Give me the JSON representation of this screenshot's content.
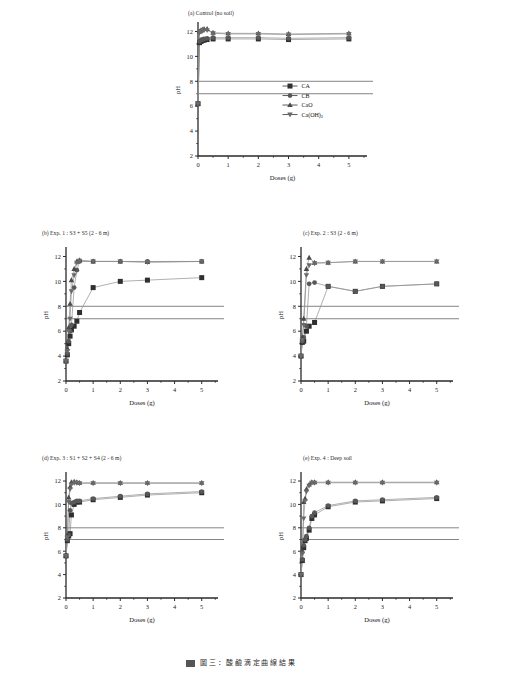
{
  "figure": {
    "caption_fragment": "圖 三 ： 酸 鹼 滴 定 曲 線 結 果"
  },
  "legend": {
    "position": "inside-lower-right-panel-a",
    "items": [
      {
        "label": "CA",
        "marker": "filled-square",
        "icon_name": "legend-marker-square"
      },
      {
        "label": "CB",
        "marker": "filled-circle",
        "icon_name": "legend-marker-circle"
      },
      {
        "label": "CaO",
        "marker": "filled-triangle",
        "icon_name": "legend-marker-triangle-up"
      },
      {
        "label": "Ca(OH)2",
        "marker": "filled-triangle-down",
        "icon_name": "legend-marker-triangle-down"
      }
    ]
  },
  "colors": {
    "axis": "#2b2b2b",
    "reference_line": "#6e6e6e",
    "series_line": "#8e8e8e",
    "marker_dark": "#2f2f2f",
    "marker_mid": "#585858",
    "background": "#ffffff"
  },
  "chart_data": [
    {
      "id": "panel-a",
      "type": "scatter",
      "title": "(a) Control (no soil)",
      "xlabel": "Doses (g)",
      "ylabel": "pH",
      "xlim": [
        0,
        5.6
      ],
      "ylim": [
        2,
        12.6
      ],
      "xticks": [
        0,
        1,
        2,
        3,
        4,
        5
      ],
      "yticks": [
        2,
        4,
        6,
        8,
        10,
        12
      ],
      "grid": false,
      "reference_lines": [
        8.0,
        7.0
      ],
      "series": [
        {
          "name": "CA",
          "marker": "filled-square",
          "x": [
            0,
            0.05,
            0.1,
            0.15,
            0.2,
            0.3,
            0.5,
            1,
            2,
            3,
            5
          ],
          "y": [
            6.2,
            11.1,
            11.2,
            11.3,
            11.3,
            11.35,
            11.4,
            11.4,
            11.4,
            11.35,
            11.4
          ]
        },
        {
          "name": "CB",
          "marker": "filled-circle",
          "x": [
            0,
            0.05,
            0.1,
            0.15,
            0.2,
            0.3,
            0.5,
            1,
            2,
            3,
            5
          ],
          "y": [
            6.2,
            11.2,
            11.3,
            11.35,
            11.4,
            11.45,
            11.5,
            11.5,
            11.5,
            11.45,
            11.5
          ]
        },
        {
          "name": "CaO",
          "marker": "filled-triangle",
          "x": [
            0,
            0.05,
            0.1,
            0.15,
            0.2,
            0.3,
            0.5,
            1,
            2,
            3,
            5
          ],
          "y": [
            6.2,
            12.0,
            12.1,
            12.15,
            12.2,
            12.2,
            11.9,
            11.85,
            11.85,
            11.8,
            11.85
          ]
        },
        {
          "name": "Ca(OH)2",
          "marker": "filled-triangle-down",
          "x": [
            0,
            0.05,
            0.1,
            0.15,
            0.2,
            0.3,
            0.5,
            1,
            2,
            3,
            5
          ],
          "y": [
            6.2,
            11.9,
            12.0,
            12.05,
            12.1,
            12.1,
            11.85,
            11.8,
            11.8,
            11.75,
            11.8
          ]
        }
      ]
    },
    {
      "id": "panel-b",
      "type": "scatter",
      "title": "(b) Exp. 1 : S3 + S5 (2 - 6 m)",
      "xlabel": "Doses (g)",
      "ylabel": "pH",
      "xlim": [
        0,
        5.6
      ],
      "ylim": [
        2,
        12.6
      ],
      "xticks": [
        0,
        1,
        2,
        3,
        4,
        5
      ],
      "yticks": [
        2,
        4,
        6,
        8,
        10,
        12
      ],
      "grid": false,
      "reference_lines": [
        8.0,
        7.0
      ],
      "series": [
        {
          "name": "CA",
          "marker": "filled-square",
          "x": [
            0,
            0.05,
            0.1,
            0.15,
            0.2,
            0.3,
            0.4,
            0.5,
            1,
            2,
            3,
            5
          ],
          "y": [
            3.6,
            4.1,
            5.0,
            5.6,
            6.1,
            6.4,
            6.8,
            7.5,
            9.5,
            10.0,
            10.1,
            10.3
          ]
        },
        {
          "name": "CB",
          "marker": "filled-circle",
          "x": [
            0,
            0.05,
            0.1,
            0.15,
            0.2,
            0.3,
            0.4,
            0.5,
            1,
            2,
            3,
            5
          ],
          "y": [
            3.6,
            4.2,
            5.2,
            6.0,
            6.5,
            9.5,
            10.9,
            11.6,
            11.6,
            11.6,
            11.6,
            11.6
          ]
        },
        {
          "name": "CaO",
          "marker": "filled-triangle",
          "x": [
            0,
            0.05,
            0.1,
            0.15,
            0.2,
            0.3,
            0.4,
            0.5,
            1,
            2,
            3,
            5
          ],
          "y": [
            3.6,
            4.6,
            6.3,
            8.2,
            10.1,
            11.0,
            11.6,
            11.7,
            11.6,
            11.6,
            11.55,
            11.6
          ]
        },
        {
          "name": "Ca(OH)2",
          "marker": "filled-triangle-down",
          "x": [
            0,
            0.05,
            0.1,
            0.15,
            0.2,
            0.3,
            0.4,
            0.5,
            1,
            2,
            3,
            5
          ],
          "y": [
            3.6,
            4.4,
            6.0,
            7.0,
            9.2,
            10.5,
            11.5,
            11.65,
            11.6,
            11.6,
            11.55,
            11.6
          ]
        }
      ]
    },
    {
      "id": "panel-c",
      "type": "scatter",
      "title": "(c) Exp. 2 : S3 (2 - 6 m)",
      "xlabel": "Doses (g)",
      "ylabel": "pH",
      "xlim": [
        0,
        5.6
      ],
      "ylim": [
        2,
        12.6
      ],
      "xticks": [
        0,
        1,
        2,
        3,
        4,
        5
      ],
      "yticks": [
        2,
        4,
        6,
        8,
        10,
        12
      ],
      "grid": false,
      "reference_lines": [
        8.0,
        7.0
      ],
      "series": [
        {
          "name": "CA",
          "marker": "filled-square",
          "x": [
            0,
            0.05,
            0.1,
            0.2,
            0.3,
            0.5,
            1,
            2,
            3,
            5
          ],
          "y": [
            4.0,
            5.1,
            5.2,
            6.0,
            6.4,
            6.7,
            9.6,
            9.2,
            9.6,
            9.8
          ]
        },
        {
          "name": "CB",
          "marker": "filled-circle",
          "x": [
            0,
            0.05,
            0.1,
            0.2,
            0.3,
            0.5,
            1,
            2,
            3,
            5
          ],
          "y": [
            4.0,
            5.2,
            5.5,
            6.4,
            9.8,
            9.9,
            9.6,
            9.2,
            9.6,
            9.8
          ]
        },
        {
          "name": "CaO",
          "marker": "filled-triangle",
          "x": [
            0,
            0.05,
            0.1,
            0.2,
            0.3,
            0.5,
            1,
            2,
            3,
            5
          ],
          "y": [
            4.0,
            5.5,
            7.0,
            11.0,
            11.9,
            11.5,
            11.5,
            11.6,
            11.6,
            11.6
          ]
        },
        {
          "name": "Ca(OH)2",
          "marker": "filled-triangle-down",
          "x": [
            0,
            0.05,
            0.1,
            0.2,
            0.3,
            0.5,
            1,
            2,
            3,
            5
          ],
          "y": [
            4.0,
            5.3,
            6.5,
            10.5,
            11.3,
            11.45,
            11.5,
            11.6,
            11.6,
            11.6
          ]
        }
      ]
    },
    {
      "id": "panel-d",
      "type": "scatter",
      "title": "(d) Exp. 3 : S1 + S2 + S4 (2 - 6 m)",
      "xlabel": "Doses (g)",
      "ylabel": "pH",
      "xlim": [
        0,
        5.6
      ],
      "ylim": [
        2,
        12.6
      ],
      "xticks": [
        0,
        1,
        2,
        3,
        4,
        5
      ],
      "yticks": [
        2,
        4,
        6,
        8,
        10,
        12
      ],
      "grid": false,
      "reference_lines": [
        8.0,
        7.0
      ],
      "series": [
        {
          "name": "CA",
          "marker": "filled-square",
          "x": [
            0,
            0.05,
            0.1,
            0.15,
            0.2,
            0.3,
            0.4,
            0.5,
            1,
            2,
            3,
            5
          ],
          "y": [
            5.6,
            6.9,
            7.3,
            7.5,
            9.1,
            10.0,
            10.2,
            10.2,
            10.4,
            10.6,
            10.8,
            11.0
          ]
        },
        {
          "name": "CB",
          "marker": "filled-circle",
          "x": [
            0,
            0.05,
            0.1,
            0.15,
            0.2,
            0.3,
            0.4,
            0.5,
            1,
            2,
            3,
            5
          ],
          "y": [
            5.6,
            7.0,
            7.4,
            9.5,
            10.1,
            10.2,
            10.3,
            10.3,
            10.5,
            10.7,
            10.9,
            11.1
          ]
        },
        {
          "name": "CaO",
          "marker": "filled-triangle",
          "x": [
            0,
            0.05,
            0.1,
            0.15,
            0.2,
            0.3,
            0.4,
            0.5,
            1,
            2,
            3,
            5
          ],
          "y": [
            5.6,
            7.4,
            10.6,
            11.5,
            11.9,
            11.95,
            11.9,
            11.85,
            11.85,
            11.85,
            11.85,
            11.85
          ]
        },
        {
          "name": "Ca(OH)2",
          "marker": "filled-triangle-down",
          "x": [
            0,
            0.05,
            0.1,
            0.15,
            0.2,
            0.3,
            0.4,
            0.5,
            1,
            2,
            3,
            5
          ],
          "y": [
            5.6,
            7.2,
            10.2,
            11.3,
            11.7,
            11.85,
            11.85,
            11.8,
            11.8,
            11.8,
            11.8,
            11.8
          ]
        }
      ]
    },
    {
      "id": "panel-e",
      "type": "scatter",
      "title": "(e) Exp. 4 : Deep soil",
      "xlabel": "Doses (g)",
      "ylabel": "pH",
      "xlim": [
        0,
        5.6
      ],
      "ylim": [
        2,
        12.6
      ],
      "xticks": [
        0,
        1,
        2,
        3,
        4,
        5
      ],
      "yticks": [
        2,
        4,
        6,
        8,
        10,
        12
      ],
      "grid": false,
      "reference_lines": [
        8.0,
        7.0
      ],
      "series": [
        {
          "name": "CA",
          "marker": "filled-square",
          "x": [
            0,
            0.05,
            0.1,
            0.15,
            0.2,
            0.3,
            0.4,
            0.5,
            1,
            2,
            3,
            5
          ],
          "y": [
            4.0,
            5.2,
            6.3,
            6.9,
            7.1,
            7.8,
            8.8,
            9.1,
            9.8,
            10.2,
            10.3,
            10.5
          ]
        },
        {
          "name": "CB",
          "marker": "filled-circle",
          "x": [
            0,
            0.05,
            0.1,
            0.15,
            0.2,
            0.3,
            0.4,
            0.5,
            1,
            2,
            3,
            5
          ],
          "y": [
            4.0,
            5.3,
            6.5,
            7.0,
            7.3,
            8.0,
            9.0,
            9.3,
            9.9,
            10.3,
            10.4,
            10.6
          ]
        },
        {
          "name": "CaO",
          "marker": "filled-triangle",
          "x": [
            0,
            0.05,
            0.1,
            0.15,
            0.2,
            0.3,
            0.4,
            0.5,
            1,
            2,
            3,
            5
          ],
          "y": [
            4.0,
            6.0,
            10.2,
            10.5,
            11.3,
            11.7,
            11.9,
            11.9,
            11.9,
            11.9,
            11.9,
            11.9
          ]
        },
        {
          "name": "Ca(OH)2",
          "marker": "filled-triangle-down",
          "x": [
            0,
            0.05,
            0.1,
            0.15,
            0.2,
            0.3,
            0.4,
            0.5,
            1,
            2,
            3,
            5
          ],
          "y": [
            4.0,
            5.8,
            8.8,
            10.3,
            11.1,
            11.6,
            11.85,
            11.85,
            11.85,
            11.85,
            11.85,
            11.85
          ]
        }
      ]
    }
  ]
}
